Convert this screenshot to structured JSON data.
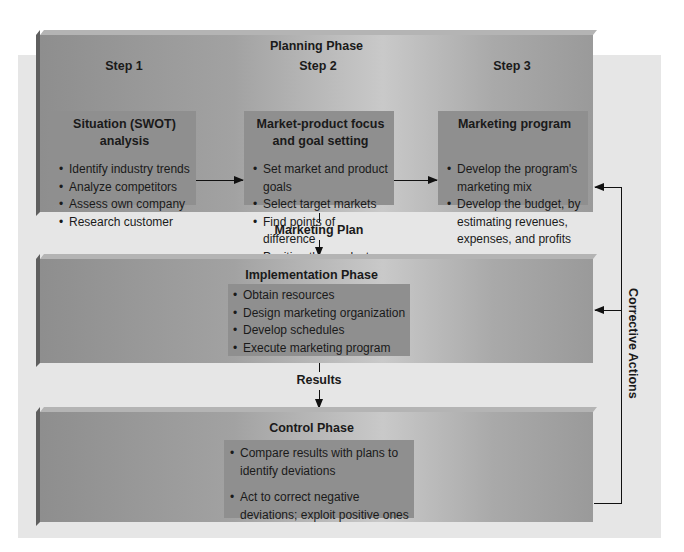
{
  "planning": {
    "title": "Planning Phase",
    "steps": [
      {
        "label": "Step 1",
        "title_lines": [
          "Situation (SWOT)",
          "analysis"
        ],
        "bullets": [
          "Identify industry trends",
          "Analyze competitors",
          "Assess own company",
          "Research customer"
        ]
      },
      {
        "label": "Step 2",
        "title_lines": [
          "Market-product focus",
          "and goal setting"
        ],
        "bullets": [
          "Set market and product goals",
          "Select target markets",
          "Find points of difference",
          "Position the product"
        ]
      },
      {
        "label": "Step 3",
        "title_lines": [
          "Marketing program"
        ],
        "bullets": [
          "Develop the program's marketing mix",
          "Develop the budget, by estimating revenues, expenses, and profits"
        ]
      }
    ]
  },
  "flows": {
    "marketing_plan": "Marketing Plan",
    "results": "Results",
    "corrective_actions": "Corrective Actions"
  },
  "implementation": {
    "title": "Implementation Phase",
    "bullets": [
      "Obtain resources",
      "Design marketing organization",
      "Develop schedules",
      "Execute marketing program"
    ]
  },
  "control": {
    "title": "Control Phase",
    "bullets": [
      "Compare results with plans to identify deviations",
      "Act to correct negative deviations; exploit positive ones"
    ]
  },
  "colors": {
    "panel": "#e6e6e6",
    "phase_box": "#a2a2a2",
    "inner_box": "#8f8f8f",
    "line": "#111111"
  }
}
